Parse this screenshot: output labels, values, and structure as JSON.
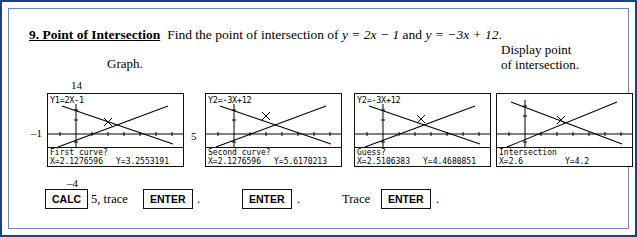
{
  "problem": {
    "number": "9. Point of Intersection",
    "text": "Find the point of intersection of ",
    "eq1": "y = 2x − 1",
    "conj": " and ",
    "eq2": "y = −3x + 12",
    "period": "."
  },
  "labels": {
    "graph": "Graph.",
    "display_line1": "Display point",
    "display_line2": "of intersection."
  },
  "axis_notes": {
    "ymax": "14",
    "xmin": "–1",
    "xmax": "5",
    "ymin": "–4"
  },
  "calculators": [
    {
      "name": "calc-screen-1",
      "top_text": "Y1=2X-1",
      "bottom_line1": "First curve?",
      "bottom_x": "X=2.1276596",
      "bottom_y": "Y=3.2553191"
    },
    {
      "name": "calc-screen-2",
      "top_text": "Y2=-3X+12",
      "bottom_line1": "Second curve?",
      "bottom_x": "X=2.1276596",
      "bottom_y": "Y=5.6170213"
    },
    {
      "name": "calc-screen-3",
      "top_text": "Y2=-3X+12",
      "bottom_line1": "Guess?",
      "bottom_x": "X=2.5106383",
      "bottom_y": "Y=4.4680851"
    },
    {
      "name": "calc-screen-4",
      "top_text": "",
      "bottom_line1": "Intersection",
      "bottom_x": "X=2.6",
      "bottom_y": "Y=4.2"
    }
  ],
  "keyrow": {
    "calc_key": "CALC",
    "after_calc": "5, trace",
    "enter1": "ENTER",
    "period1": ".",
    "enter2": "ENTER",
    "period2": ".",
    "trace_word": "Trace",
    "enter3": "ENTER",
    "period3": "."
  },
  "colors": {
    "border_outer": "#1b3f8f",
    "border_inner": "#6e86bd",
    "ink": "#000000",
    "paper": "#ffffff"
  }
}
